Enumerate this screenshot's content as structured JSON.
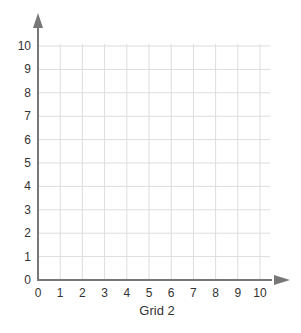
{
  "chart_data": {
    "type": "scatter",
    "title": "Grid 2",
    "xlabel": "",
    "ylabel": "",
    "x_ticks": [
      "0",
      "1",
      "2",
      "3",
      "4",
      "5",
      "6",
      "7",
      "8",
      "9",
      "10"
    ],
    "y_ticks": [
      "0",
      "1",
      "2",
      "3",
      "4",
      "5",
      "6",
      "7",
      "8",
      "9",
      "10"
    ],
    "xlim": [
      0,
      10
    ],
    "ylim": [
      0,
      10
    ],
    "grid": true,
    "series": [],
    "colors": {
      "axis": "#777777",
      "grid": "#dddddd",
      "text": "#333333"
    }
  }
}
